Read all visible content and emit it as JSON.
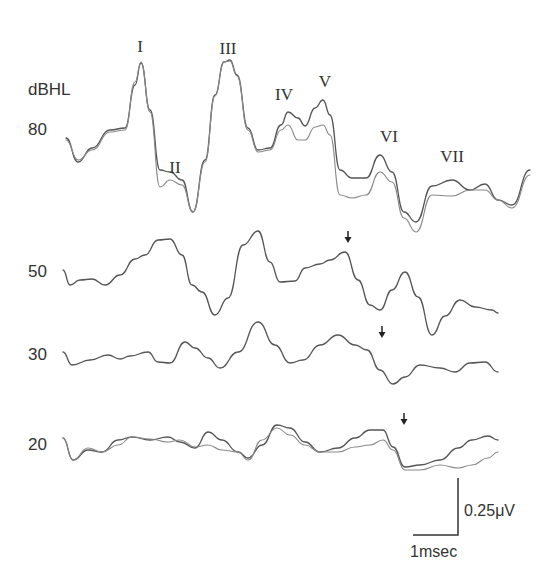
{
  "chart_data": {
    "type": "line",
    "title": "",
    "ylabel": "dBHL",
    "xlabel": "",
    "units_label": "dBHL",
    "scale_bar": {
      "voltage": "0.25μV",
      "time": "1msec"
    },
    "peak_labels": [
      {
        "label": "I",
        "x": 140,
        "y": 47
      },
      {
        "label": "II",
        "x": 175,
        "y": 168
      },
      {
        "label": "III",
        "x": 228,
        "y": 49
      },
      {
        "label": "IV",
        "x": 284,
        "y": 95
      },
      {
        "label": "V",
        "x": 325,
        "y": 82
      },
      {
        "label": "VI",
        "x": 389,
        "y": 137
      },
      {
        "label": "VII",
        "x": 452,
        "y": 157
      }
    ],
    "series": [
      {
        "name": "80",
        "label_y": 130,
        "traces": 2,
        "points": [
          [
            66,
            138
          ],
          [
            78,
            162
          ],
          [
            92,
            148
          ],
          [
            110,
            130
          ],
          [
            125,
            128
          ],
          [
            135,
            85
          ],
          [
            141,
            63
          ],
          [
            150,
            110
          ],
          [
            160,
            170
          ],
          [
            170,
            172
          ],
          [
            182,
            180
          ],
          [
            193,
            212
          ],
          [
            205,
            160
          ],
          [
            215,
            95
          ],
          [
            224,
            62
          ],
          [
            230,
            60
          ],
          [
            237,
            75
          ],
          [
            248,
            128
          ],
          [
            258,
            150
          ],
          [
            270,
            148
          ],
          [
            281,
            125
          ],
          [
            288,
            112
          ],
          [
            298,
            118
          ],
          [
            305,
            126
          ],
          [
            315,
            108
          ],
          [
            323,
            100
          ],
          [
            330,
            115
          ],
          [
            340,
            170
          ],
          [
            352,
            178
          ],
          [
            366,
            178
          ],
          [
            380,
            155
          ],
          [
            392,
            172
          ],
          [
            404,
            212
          ],
          [
            416,
            222
          ],
          [
            432,
            186
          ],
          [
            452,
            180
          ],
          [
            470,
            190
          ],
          [
            485,
            184
          ],
          [
            498,
            200
          ],
          [
            512,
            205
          ],
          [
            530,
            170
          ]
        ],
        "points2": [
          [
            66,
            140
          ],
          [
            78,
            160
          ],
          [
            92,
            150
          ],
          [
            110,
            132
          ],
          [
            125,
            130
          ],
          [
            135,
            82
          ],
          [
            141,
            62
          ],
          [
            150,
            112
          ],
          [
            160,
            187
          ],
          [
            170,
            180
          ],
          [
            182,
            185
          ],
          [
            193,
            212
          ],
          [
            205,
            162
          ],
          [
            215,
            96
          ],
          [
            224,
            62
          ],
          [
            230,
            61
          ],
          [
            237,
            76
          ],
          [
            248,
            130
          ],
          [
            258,
            152
          ],
          [
            270,
            150
          ],
          [
            281,
            130
          ],
          [
            288,
            125
          ],
          [
            298,
            140
          ],
          [
            305,
            140
          ],
          [
            315,
            127
          ],
          [
            323,
            125
          ],
          [
            330,
            135
          ],
          [
            340,
            195
          ],
          [
            352,
            198
          ],
          [
            366,
            195
          ],
          [
            380,
            172
          ],
          [
            392,
            182
          ],
          [
            404,
            218
          ],
          [
            416,
            232
          ],
          [
            432,
            195
          ],
          [
            452,
            196
          ],
          [
            470,
            190
          ],
          [
            485,
            190
          ],
          [
            498,
            200
          ],
          [
            512,
            208
          ],
          [
            530,
            175
          ]
        ]
      },
      {
        "name": "50",
        "label_y": 272,
        "traces": 1,
        "points": [
          [
            63,
            270
          ],
          [
            70,
            285
          ],
          [
            80,
            280
          ],
          [
            92,
            279
          ],
          [
            105,
            285
          ],
          [
            120,
            275
          ],
          [
            135,
            259
          ],
          [
            145,
            255
          ],
          [
            158,
            240
          ],
          [
            170,
            239
          ],
          [
            182,
            255
          ],
          [
            192,
            285
          ],
          [
            202,
            292
          ],
          [
            215,
            315
          ],
          [
            228,
            298
          ],
          [
            243,
            245
          ],
          [
            258,
            231
          ],
          [
            270,
            262
          ],
          [
            280,
            282
          ],
          [
            295,
            281
          ],
          [
            305,
            268
          ],
          [
            320,
            264
          ],
          [
            330,
            260
          ],
          [
            345,
            252
          ],
          [
            358,
            280
          ],
          [
            370,
            305
          ],
          [
            380,
            310
          ],
          [
            392,
            290
          ],
          [
            405,
            272
          ],
          [
            418,
            297
          ],
          [
            432,
            335
          ],
          [
            445,
            316
          ],
          [
            460,
            300
          ],
          [
            475,
            307
          ],
          [
            492,
            310
          ],
          [
            498,
            313
          ]
        ]
      },
      {
        "name": "30",
        "label_y": 355,
        "traces": 1,
        "points": [
          [
            63,
            352
          ],
          [
            72,
            365
          ],
          [
            90,
            360
          ],
          [
            108,
            355
          ],
          [
            120,
            359
          ],
          [
            130,
            356
          ],
          [
            148,
            352
          ],
          [
            158,
            362
          ],
          [
            170,
            363
          ],
          [
            185,
            342
          ],
          [
            195,
            348
          ],
          [
            208,
            358
          ],
          [
            220,
            368
          ],
          [
            238,
            352
          ],
          [
            258,
            322
          ],
          [
            275,
            345
          ],
          [
            290,
            363
          ],
          [
            303,
            360
          ],
          [
            320,
            345
          ],
          [
            338,
            335
          ],
          [
            355,
            345
          ],
          [
            367,
            350
          ],
          [
            380,
            370
          ],
          [
            393,
            384
          ],
          [
            405,
            377
          ],
          [
            420,
            365
          ],
          [
            440,
            368
          ],
          [
            455,
            372
          ],
          [
            470,
            363
          ],
          [
            485,
            362
          ],
          [
            498,
            372
          ]
        ]
      },
      {
        "name": "20",
        "label_y": 445,
        "traces": 2,
        "points": [
          [
            63,
            438
          ],
          [
            73,
            460
          ],
          [
            88,
            450
          ],
          [
            102,
            452
          ],
          [
            118,
            440
          ],
          [
            132,
            437
          ],
          [
            150,
            440
          ],
          [
            168,
            437
          ],
          [
            180,
            442
          ],
          [
            195,
            448
          ],
          [
            208,
            432
          ],
          [
            222,
            440
          ],
          [
            238,
            452
          ],
          [
            248,
            458
          ],
          [
            262,
            445
          ],
          [
            277,
            425
          ],
          [
            290,
            428
          ],
          [
            305,
            442
          ],
          [
            320,
            452
          ],
          [
            338,
            448
          ],
          [
            355,
            438
          ],
          [
            370,
            430
          ],
          [
            383,
            430
          ],
          [
            393,
            447
          ],
          [
            405,
            467
          ],
          [
            420,
            465
          ],
          [
            440,
            460
          ],
          [
            458,
            448
          ],
          [
            472,
            440
          ],
          [
            488,
            436
          ],
          [
            498,
            440
          ]
        ],
        "points2": [
          [
            63,
            438
          ],
          [
            73,
            460
          ],
          [
            88,
            448
          ],
          [
            102,
            452
          ],
          [
            118,
            445
          ],
          [
            132,
            437
          ],
          [
            150,
            439
          ],
          [
            168,
            442
          ],
          [
            180,
            440
          ],
          [
            195,
            447
          ],
          [
            208,
            445
          ],
          [
            222,
            450
          ],
          [
            238,
            452
          ],
          [
            248,
            460
          ],
          [
            262,
            440
          ],
          [
            277,
            428
          ],
          [
            290,
            435
          ],
          [
            305,
            445
          ],
          [
            320,
            452
          ],
          [
            338,
            452
          ],
          [
            355,
            447
          ],
          [
            370,
            445
          ],
          [
            383,
            440
          ],
          [
            393,
            450
          ],
          [
            405,
            470
          ],
          [
            420,
            470
          ],
          [
            440,
            465
          ],
          [
            458,
            468
          ],
          [
            472,
            465
          ],
          [
            488,
            458
          ],
          [
            498,
            452
          ]
        ]
      }
    ],
    "arrows": [
      {
        "series": "50",
        "x": 348,
        "y": 238
      },
      {
        "series": "30",
        "x": 382,
        "y": 333
      },
      {
        "series": "20",
        "x": 404,
        "y": 420
      }
    ]
  },
  "colors": {
    "trace": "#555555",
    "trace2": "#888888",
    "text": "#333333"
  }
}
